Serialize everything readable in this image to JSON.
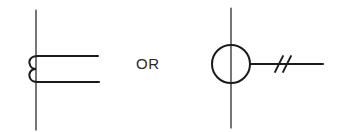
{
  "diagram": {
    "type": "electrical-symbol-equivalence",
    "connector_text": "OR",
    "symbols": [
      {
        "id": "left",
        "description": "vertical line with two horizontal leads connected by a double-loop (coil-like) bend",
        "icon": "coil-tap-icon"
      },
      {
        "id": "right",
        "description": "circle on vertical line with horizontal lead crossed by two slash marks",
        "icon": "circle-double-slash-lead-icon"
      }
    ],
    "colors": {
      "stroke": "#1a1a1a",
      "text": "#2a2a2a",
      "background": "#ffffff"
    }
  }
}
